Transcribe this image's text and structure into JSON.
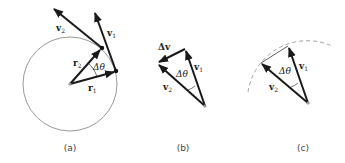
{
  "panels": [
    {
      "id": "a",
      "caption": "(a)",
      "labels": {
        "v1": "v",
        "v1_sub": "1",
        "v2": "v",
        "v2_sub": "2",
        "r1": "r",
        "r1_sub": "1",
        "r2": "r",
        "r2_sub": "2",
        "angle": "Δθ"
      }
    },
    {
      "id": "b",
      "caption": "(b)",
      "labels": {
        "dv": "Δv",
        "v1": "v",
        "v1_sub": "1",
        "v2": "v",
        "v2_sub": "2",
        "angle": "Δθ"
      }
    },
    {
      "id": "c",
      "caption": "(c)",
      "labels": {
        "v1": "v",
        "v1_sub": "1",
        "v2": "v",
        "v2_sub": "2",
        "angle": "Δθ"
      }
    }
  ],
  "colors": {
    "vector": "#1a1a1a",
    "circle": "#9a9a9a",
    "origin_dot": "#9a9a9a"
  }
}
